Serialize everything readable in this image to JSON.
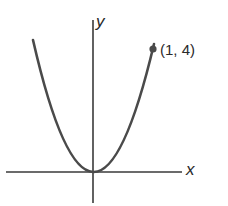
{
  "figure": {
    "type": "parabola graph",
    "axes": {
      "x_label": "x",
      "y_label": "y"
    },
    "point": {
      "label": "(1, 4)",
      "x": 1,
      "y": 4
    },
    "curve": "y = 4x^2",
    "colors": {
      "curve": "#4a4a4a",
      "axes": "#3a3a3a",
      "text": "#2a2a2a"
    }
  }
}
